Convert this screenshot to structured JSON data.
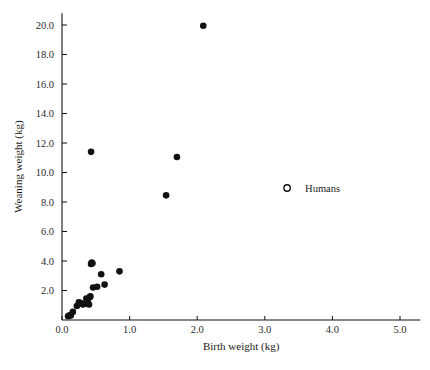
{
  "chart_data": {
    "type": "scatter",
    "title": "",
    "xlabel": "Birth weight (kg)",
    "ylabel": "Weaning weight (kg)",
    "xlim": [
      0.0,
      5.3
    ],
    "ylim": [
      0.0,
      20.8
    ],
    "xticks": [
      "0.0",
      "1.0",
      "2.0",
      "3.0",
      "4.0",
      "5.0"
    ],
    "xtick_values": [
      0.0,
      1.0,
      2.0,
      3.0,
      4.0,
      5.0
    ],
    "yticks": [
      "2.0",
      "4.0",
      "6.0",
      "8.0",
      "10.0",
      "12.0",
      "14.0",
      "16.0",
      "18.0",
      "20.0"
    ],
    "ytick_values": [
      2.0,
      4.0,
      6.0,
      8.0,
      10.0,
      12.0,
      14.0,
      16.0,
      18.0,
      20.0
    ],
    "grid": false,
    "legend_position": "inside-right",
    "series": [
      {
        "name": "Primates",
        "marker": "filled-circle",
        "color": "#111111",
        "points": [
          [
            0.09,
            0.25
          ],
          [
            0.11,
            0.32
          ],
          [
            0.13,
            0.3
          ],
          [
            0.16,
            0.55
          ],
          [
            0.22,
            0.95
          ],
          [
            0.25,
            1.2
          ],
          [
            0.28,
            1.15
          ],
          [
            0.31,
            1.05
          ],
          [
            0.34,
            1.1
          ],
          [
            0.36,
            1.45
          ],
          [
            0.38,
            1.35
          ],
          [
            0.4,
            1.05
          ],
          [
            0.41,
            1.55
          ],
          [
            0.42,
            1.6
          ],
          [
            0.43,
            3.8
          ],
          [
            0.44,
            3.9
          ],
          [
            0.45,
            3.85
          ],
          [
            0.46,
            2.2
          ],
          [
            0.52,
            2.25
          ],
          [
            0.58,
            3.1
          ],
          [
            0.63,
            2.4
          ],
          [
            0.85,
            3.3
          ],
          [
            0.43,
            11.4
          ],
          [
            1.54,
            8.45
          ],
          [
            1.7,
            11.05
          ],
          [
            2.09,
            19.95
          ]
        ]
      },
      {
        "name": "Humans",
        "marker": "open-circle",
        "color": "#111111",
        "points": []
      }
    ],
    "legend": [
      {
        "label": "Humans",
        "marker": "open-circle",
        "x": 3.33,
        "y": 8.95
      }
    ]
  }
}
